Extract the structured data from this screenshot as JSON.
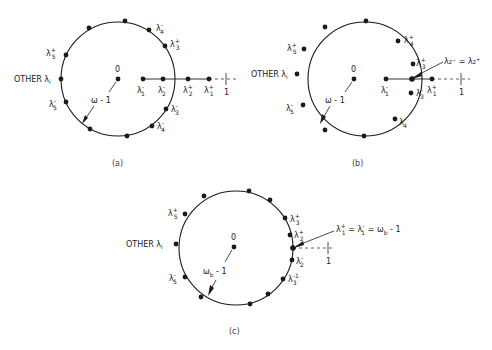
{
  "figure": {
    "ink_color": "#1a1a1a",
    "panels": [
      {
        "id": "a",
        "caption": "(a)",
        "center_label": "0",
        "radius_label": "ω - 1",
        "other_label": "OTHER λ",
        "other_sub": "i",
        "circle_labels": [
          {
            "base": "λ",
            "sub": "4",
            "sup": "-"
          },
          {
            "base": "λ",
            "sub": "3",
            "sup": "+"
          },
          {
            "base": "λ",
            "sub": "5",
            "sup": "+"
          },
          {
            "base": "λ",
            "sub": "5",
            "sup": "-"
          },
          {
            "base": "λ",
            "sub": "3",
            "sup": "-"
          },
          {
            "base": "λ",
            "sub": "4",
            "sup": "-"
          }
        ],
        "axis_labels": [
          {
            "base": "λ",
            "sub": "1",
            "sup": "-"
          },
          {
            "base": "λ",
            "sub": "2",
            "sup": "-"
          },
          {
            "base": "λ",
            "sub": "2",
            "sup": "+"
          },
          {
            "base": "λ",
            "sub": "1",
            "sup": "+"
          }
        ],
        "tick_label": "1"
      },
      {
        "id": "b",
        "caption": "(b)",
        "center_label": "0",
        "radius_label": "ω - 1",
        "other_label": "OTHER λ",
        "other_sub": "i",
        "circle_labels": [
          {
            "base": "λ",
            "sub": "4",
            "sup": "+"
          },
          {
            "base": "λ",
            "sub": "3",
            "sup": "+"
          },
          {
            "base": "λ",
            "sub": "5",
            "sup": "+"
          },
          {
            "base": "λ",
            "sub": "5",
            "sup": "-"
          },
          {
            "base": "λ",
            "sub": "3",
            "sup": "-"
          },
          {
            "base": "λ",
            "sub": "4",
            "sup": "-"
          }
        ],
        "axis_labels": [
          {
            "base": "λ",
            "sub": "1",
            "sup": "-"
          },
          {
            "base": "λ",
            "sub": "1",
            "sup": "+"
          }
        ],
        "callout": "λ₂⁻ = λ₂⁺",
        "tick_label": "1"
      },
      {
        "id": "c",
        "caption": "(c)",
        "center_label": "0",
        "radius_label": "ω_b - 1",
        "other_label": "OTHER λ",
        "other_sub": "i",
        "circle_labels": [
          {
            "base": "λ",
            "sub": "5",
            "sup": "+"
          },
          {
            "base": "λ",
            "sub": "3",
            "sup": "+"
          },
          {
            "base": "λ",
            "sub": "2",
            "sup": "+"
          },
          {
            "base": "λ",
            "sub": "2",
            "sup": "-"
          },
          {
            "base": "λ",
            "sub": "3",
            "sup": "-"
          },
          {
            "base": "λ",
            "sub": "5",
            "sup": "-"
          }
        ],
        "callout": "λ₁⁺ = λ₁⁻ = ω_b - 1",
        "tick_label": "1"
      }
    ]
  }
}
